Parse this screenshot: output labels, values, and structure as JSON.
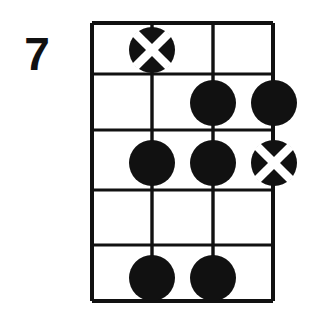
{
  "diagram": {
    "type": "bass-chord-diagram",
    "fret_label": "7",
    "colors": {
      "ink": "#111111",
      "paper": "#ffffff",
      "marker_fill": "#111111",
      "marker_x": "#ffffff"
    },
    "grid": {
      "string_count": 4,
      "fret_space_count": 5,
      "string_x": [
        92,
        152,
        213,
        273
      ],
      "fret_y": [
        23,
        74,
        130,
        190,
        245,
        301
      ],
      "left": 92,
      "right": 273,
      "top": 23,
      "bottom": 301
    },
    "markers": [
      {
        "name": "marker-x-string1-fret1",
        "string": 1,
        "fret": 1,
        "cx": 152,
        "cy": 50,
        "r": 23,
        "style": "x"
      },
      {
        "name": "marker-dot-string3-fret2",
        "string": 3,
        "fret": 2,
        "cx": 213,
        "cy": 103,
        "r": 23,
        "style": "dot"
      },
      {
        "name": "marker-dot-string4-fret2",
        "string": 4,
        "fret": 2,
        "cx": 274,
        "cy": 103,
        "r": 23,
        "style": "dot"
      },
      {
        "name": "marker-dot-string2-fret3",
        "string": 2,
        "fret": 3,
        "cx": 152,
        "cy": 163,
        "r": 23,
        "style": "dot"
      },
      {
        "name": "marker-dot-string3-fret3",
        "string": 3,
        "fret": 3,
        "cx": 213,
        "cy": 163,
        "r": 23,
        "style": "dot"
      },
      {
        "name": "marker-x-string4-fret3",
        "string": 4,
        "fret": 3,
        "cx": 274,
        "cy": 163,
        "r": 23,
        "style": "x"
      },
      {
        "name": "marker-dot-string2-fret5",
        "string": 2,
        "fret": 5,
        "cx": 152,
        "cy": 278,
        "r": 23,
        "style": "dot"
      },
      {
        "name": "marker-dot-string3-fret5",
        "string": 3,
        "fret": 5,
        "cx": 213,
        "cy": 278,
        "r": 23,
        "style": "dot"
      }
    ]
  }
}
